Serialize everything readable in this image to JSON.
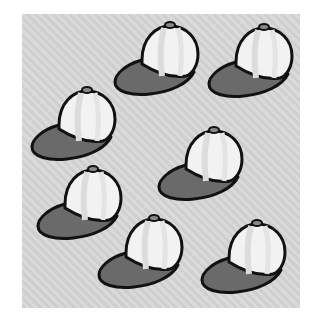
{
  "scene": {
    "description": "Seven baseball caps on a gray hatched background",
    "count": 7,
    "colors": {
      "background": "#d4d4d4",
      "crown": "#f2f2f2",
      "panel_stripe": "#e2e2e2",
      "brim": "#6a6a6a",
      "outline": "#111111",
      "button": "#888888"
    },
    "caps": [
      {
        "id": "cap-1",
        "x": 112,
        "y": 20
      },
      {
        "id": "cap-2",
        "x": 206,
        "y": 22
      },
      {
        "id": "cap-3",
        "x": 29,
        "y": 85
      },
      {
        "id": "cap-4",
        "x": 156,
        "y": 125
      },
      {
        "id": "cap-5",
        "x": 35,
        "y": 164
      },
      {
        "id": "cap-6",
        "x": 96,
        "y": 213
      },
      {
        "id": "cap-7",
        "x": 199,
        "y": 218
      }
    ]
  }
}
